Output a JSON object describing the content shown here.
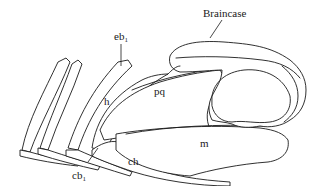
{
  "diagram": {
    "labels": {
      "braincase": "Braincase",
      "eb1_main": "eb",
      "eb1_sub": "1",
      "h": "h",
      "pq": "pq",
      "m": "m",
      "ch": "ch",
      "cb1_main": "cb",
      "cb1_sub": "1"
    },
    "colors": {
      "line": "#1a1a1a",
      "background": "#ffffff"
    }
  }
}
